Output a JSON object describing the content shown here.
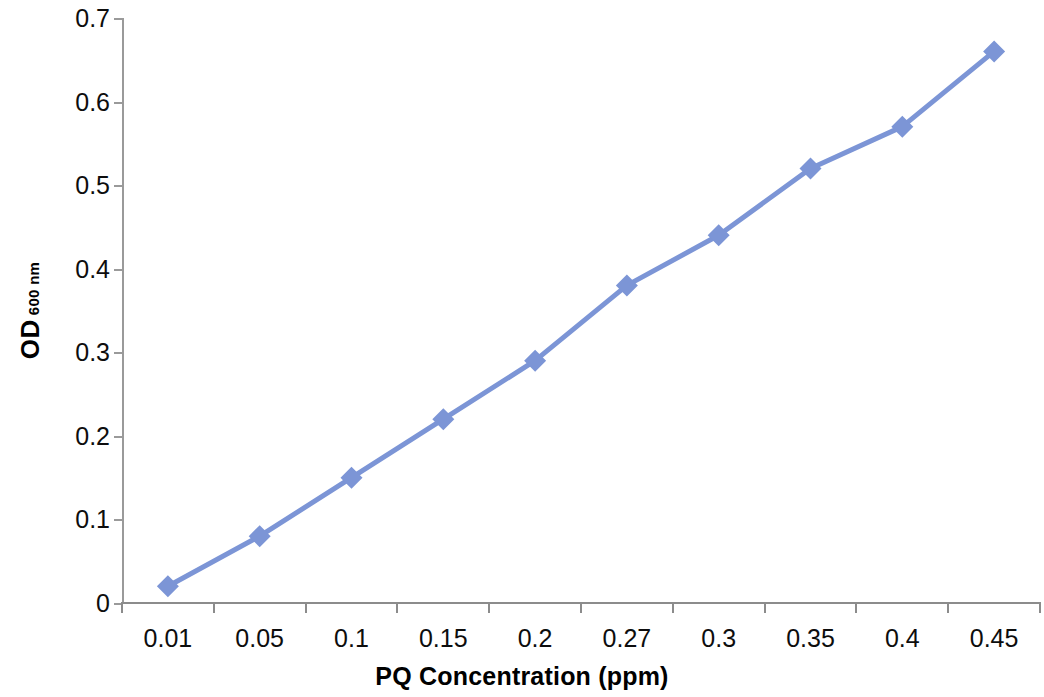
{
  "chart_data": {
    "type": "line",
    "title": "",
    "xlabel": "PQ Concentration (ppm)",
    "ylabel": "OD 600 nm",
    "ylabel_main": "OD",
    "ylabel_sub": "600 nm",
    "categories": [
      "0.01",
      "0.05",
      "0.1",
      "0.15",
      "0.2",
      "0.27",
      "0.3",
      "0.35",
      "0.4",
      "0.45"
    ],
    "values": [
      0.02,
      0.08,
      0.15,
      0.22,
      0.29,
      0.38,
      0.44,
      0.52,
      0.57,
      0.66
    ],
    "series": [
      {
        "name": "OD 600 nm",
        "values": [
          0.02,
          0.08,
          0.15,
          0.22,
          0.29,
          0.38,
          0.44,
          0.52,
          0.57,
          0.66
        ]
      }
    ],
    "ylim": [
      0,
      0.7
    ],
    "y_ticks": [
      "0",
      "0.1",
      "0.2",
      "0.3",
      "0.4",
      "0.5",
      "0.6",
      "0.7"
    ],
    "y_tick_values": [
      0,
      0.1,
      0.2,
      0.3,
      0.4,
      0.5,
      0.6,
      0.7
    ],
    "grid": false,
    "legend": "none",
    "marker": "diamond",
    "colors": {
      "series_line": "#7C95D6",
      "marker_fill": "#7C95D6",
      "axis": "#8C8C8C",
      "text": "#0D0D0D"
    }
  }
}
